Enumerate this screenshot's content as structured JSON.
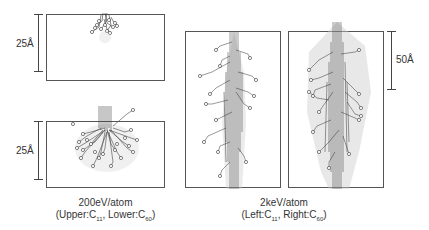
{
  "figure": {
    "panels": [
      {
        "id": "upper-left",
        "energy": "200eV/atom",
        "projectile": "C11"
      },
      {
        "id": "lower-left",
        "energy": "200eV/atom",
        "projectile": "C60"
      },
      {
        "id": "middle",
        "energy": "2keV/atom",
        "projectile": "C11"
      },
      {
        "id": "right",
        "energy": "2keV/atom",
        "projectile": "C60"
      }
    ],
    "scale_bars": {
      "upper_left": "25Å",
      "lower_left": "25Å",
      "right": "50Å"
    },
    "captions": {
      "left": {
        "line1": "200eV/atom",
        "line2_prefix": "(Upper:C",
        "line2_sub1": "11",
        "line2_mid": ", Lower:C",
        "line2_sub2": "60",
        "line2_suffix": ")"
      },
      "right": {
        "line1": "2keV/atom",
        "line2_prefix": "(Left:C",
        "line2_sub1": "11",
        "line2_mid": ", Right:C",
        "line2_sub2": "60",
        "line2_suffix": ")"
      }
    }
  }
}
